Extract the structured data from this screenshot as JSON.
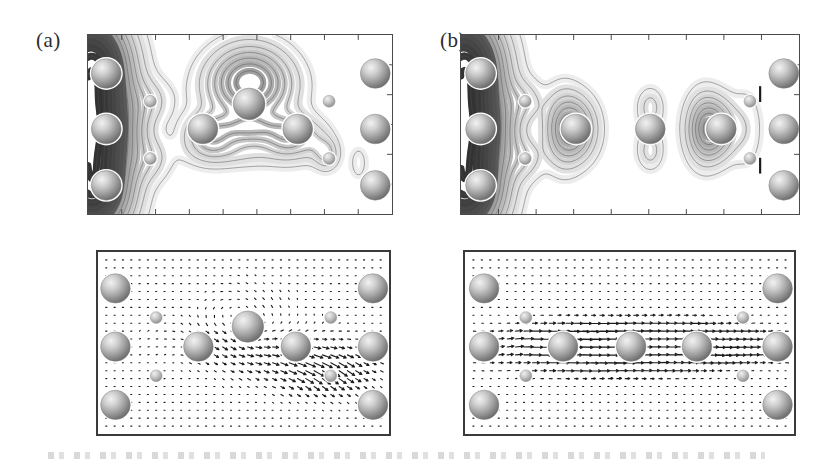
{
  "figure": {
    "type": "scientific-figure",
    "background_color": "#ffffff",
    "width": 823,
    "height": 467,
    "panel_labels": [
      {
        "id": "a",
        "text": "(a)",
        "x": 36,
        "y": 28
      },
      {
        "id": "b",
        "text": "(b)",
        "x": 440,
        "y": 28
      }
    ]
  },
  "chart_data": {
    "type": "contour",
    "title": "",
    "subtitle": "",
    "xlabel": "",
    "ylabel": "",
    "grid": false,
    "legend": "none",
    "panels": [
      {
        "id": "a-top",
        "label": "(a)",
        "kind": "contour-greyscale",
        "frame": {
          "x": 87,
          "y": 34,
          "w": 306,
          "h": 181
        },
        "ticks": {
          "top": 9,
          "bottom": 9,
          "left": 0,
          "right": 6
        },
        "contour_levels": 14,
        "colormap": "greyscale-dark-high",
        "atoms_large": [
          {
            "cx": 0.06,
            "cy": 0.215,
            "r": 15
          },
          {
            "cx": 0.06,
            "cy": 0.525,
            "r": 15
          },
          {
            "cx": 0.06,
            "cy": 0.84,
            "r": 15
          },
          {
            "cx": 0.378,
            "cy": 0.525,
            "r": 15
          },
          {
            "cx": 0.53,
            "cy": 0.385,
            "r": 16
          },
          {
            "cx": 0.69,
            "cy": 0.525,
            "r": 15
          },
          {
            "cx": 0.945,
            "cy": 0.215,
            "r": 15
          },
          {
            "cx": 0.945,
            "cy": 0.525,
            "r": 15
          },
          {
            "cx": 0.945,
            "cy": 0.84,
            "r": 15
          }
        ],
        "atoms_small": [
          {
            "cx": 0.205,
            "cy": 0.37,
            "r": 6
          },
          {
            "cx": 0.205,
            "cy": 0.69,
            "r": 6
          },
          {
            "cx": 0.793,
            "cy": 0.37,
            "r": 6
          },
          {
            "cx": 0.793,
            "cy": 0.69,
            "r": 6
          }
        ]
      },
      {
        "id": "b-top",
        "label": "(b)",
        "kind": "contour-greyscale",
        "frame": {
          "x": 460,
          "y": 34,
          "w": 340,
          "h": 181
        },
        "ticks": {
          "top": 9,
          "bottom": 9,
          "left": 0,
          "right": 6
        },
        "contour_levels": 14,
        "colormap": "greyscale-dark-high",
        "atoms_large": [
          {
            "cx": 0.058,
            "cy": 0.215,
            "r": 15
          },
          {
            "cx": 0.058,
            "cy": 0.525,
            "r": 15
          },
          {
            "cx": 0.058,
            "cy": 0.84,
            "r": 15
          },
          {
            "cx": 0.34,
            "cy": 0.525,
            "r": 15
          },
          {
            "cx": 0.56,
            "cy": 0.525,
            "r": 15
          },
          {
            "cx": 0.77,
            "cy": 0.525,
            "r": 15
          },
          {
            "cx": 0.955,
            "cy": 0.215,
            "r": 15
          },
          {
            "cx": 0.955,
            "cy": 0.525,
            "r": 15
          },
          {
            "cx": 0.955,
            "cy": 0.84,
            "r": 15
          }
        ],
        "atoms_small": [
          {
            "cx": 0.19,
            "cy": 0.37,
            "r": 6
          },
          {
            "cx": 0.19,
            "cy": 0.69,
            "r": 6
          },
          {
            "cx": 0.855,
            "cy": 0.37,
            "r": 6
          },
          {
            "cx": 0.855,
            "cy": 0.69,
            "r": 6
          }
        ],
        "markers": [
          {
            "kind": "tick-mark",
            "cx": 0.885,
            "cy": 0.33,
            "len": 16
          },
          {
            "kind": "tick-mark",
            "cx": 0.885,
            "cy": 0.73,
            "len": 16
          }
        ]
      },
      {
        "id": "a-bottom",
        "label": "",
        "kind": "vector-field",
        "frame": {
          "x": 96,
          "y": 250,
          "w": 295,
          "h": 186
        },
        "grid_cols": 34,
        "grid_rows": 22,
        "atoms_large": [
          {
            "cx": 0.06,
            "cy": 0.2,
            "r": 15
          },
          {
            "cx": 0.06,
            "cy": 0.52,
            "r": 15
          },
          {
            "cx": 0.06,
            "cy": 0.84,
            "r": 15
          },
          {
            "cx": 0.345,
            "cy": 0.52,
            "r": 15
          },
          {
            "cx": 0.515,
            "cy": 0.41,
            "r": 16
          },
          {
            "cx": 0.68,
            "cy": 0.52,
            "r": 15
          },
          {
            "cx": 0.945,
            "cy": 0.2,
            "r": 15
          },
          {
            "cx": 0.945,
            "cy": 0.52,
            "r": 15
          },
          {
            "cx": 0.945,
            "cy": 0.84,
            "r": 15
          }
        ],
        "atoms_small": [
          {
            "cx": 0.2,
            "cy": 0.36,
            "r": 6
          },
          {
            "cx": 0.2,
            "cy": 0.68,
            "r": 6
          },
          {
            "cx": 0.8,
            "cy": 0.36,
            "r": 6
          },
          {
            "cx": 0.8,
            "cy": 0.68,
            "r": 6
          }
        ]
      },
      {
        "id": "b-bottom",
        "label": "",
        "kind": "vector-field",
        "frame": {
          "x": 463,
          "y": 250,
          "w": 333,
          "h": 186
        },
        "grid_cols": 38,
        "grid_rows": 22,
        "atoms_large": [
          {
            "cx": 0.058,
            "cy": 0.2,
            "r": 15
          },
          {
            "cx": 0.058,
            "cy": 0.52,
            "r": 15
          },
          {
            "cx": 0.058,
            "cy": 0.84,
            "r": 15
          },
          {
            "cx": 0.298,
            "cy": 0.52,
            "r": 15
          },
          {
            "cx": 0.505,
            "cy": 0.52,
            "r": 15
          },
          {
            "cx": 0.705,
            "cy": 0.52,
            "r": 15
          },
          {
            "cx": 0.95,
            "cy": 0.2,
            "r": 15
          },
          {
            "cx": 0.95,
            "cy": 0.52,
            "r": 15
          },
          {
            "cx": 0.95,
            "cy": 0.84,
            "r": 15
          }
        ],
        "atoms_small": [
          {
            "cx": 0.185,
            "cy": 0.36,
            "r": 6
          },
          {
            "cx": 0.185,
            "cy": 0.68,
            "r": 6
          },
          {
            "cx": 0.845,
            "cy": 0.36,
            "r": 6
          },
          {
            "cx": 0.845,
            "cy": 0.68,
            "r": 6
          }
        ]
      }
    ],
    "colors": {
      "frame": "#4a4a4a",
      "frame_bottom": "#3a3a3a",
      "contour_line": "#555555",
      "atom_large_fill": "#9a9a9a",
      "atom_large_highlight": "#e8e8e8",
      "atom_small_fill": "#b5b5b5",
      "atom_outline": "#ffffff",
      "vector_arrow": "#1d1d1d",
      "background": "#ffffff",
      "label_text": "#2b2b2b"
    }
  }
}
